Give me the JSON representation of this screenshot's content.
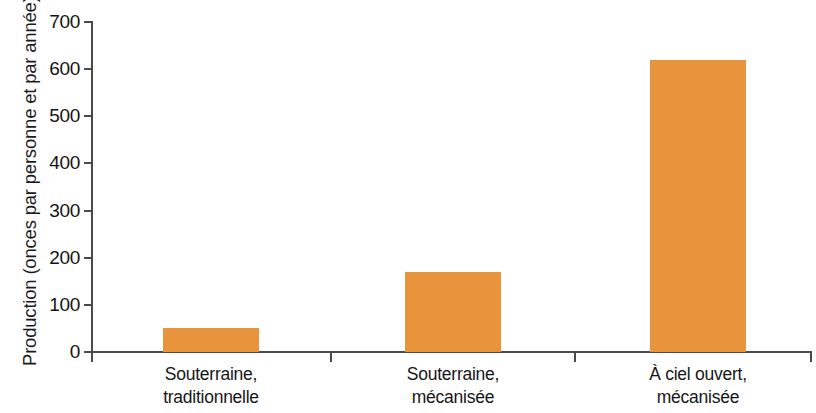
{
  "chart_data": {
    "type": "bar",
    "title": "",
    "subtitle": "",
    "xlabel": "",
    "ylabel": "Production (onces par personne et par année)",
    "categories": [
      "Souterraine, traditionnelle",
      "Souterraine, mécanisée",
      "À ciel ouvert, mécanisée"
    ],
    "category_lines": [
      [
        "Souterraine,",
        "traditionnelle"
      ],
      [
        "Souterraine,",
        "mécanisée"
      ],
      [
        "À ciel ouvert,",
        "mécanisée"
      ]
    ],
    "values": [
      50,
      170,
      620
    ],
    "ylim": [
      0,
      700
    ],
    "ytick_values": [
      0,
      100,
      200,
      300,
      400,
      500,
      600,
      700
    ],
    "ytick_labels": [
      "0",
      "100",
      "200",
      "300",
      "400",
      "500",
      "600",
      "700"
    ],
    "grid": false,
    "legend": null,
    "bar_color": "#e8943c",
    "axis_color": "#4a4a4a",
    "background_color": "#ffffff"
  },
  "axis": {
    "y_title": "Production (onces par personne et par année)"
  },
  "ticks": {
    "y": [
      {
        "label": "700",
        "value": 700
      },
      {
        "label": "600",
        "value": 600
      },
      {
        "label": "500",
        "value": 500
      },
      {
        "label": "400",
        "value": 400
      },
      {
        "label": "300",
        "value": 300
      },
      {
        "label": "200",
        "value": 200
      },
      {
        "label": "100",
        "value": 100
      },
      {
        "label": "0",
        "value": 0
      }
    ]
  },
  "bars": [
    {
      "line1": "Souterraine,",
      "line2": "traditionnelle",
      "value": 50
    },
    {
      "line1": "Souterraine,",
      "line2": "mécanisée",
      "value": 170
    },
    {
      "line1": "À ciel ouvert,",
      "line2": "mécanisée",
      "value": 620
    }
  ]
}
